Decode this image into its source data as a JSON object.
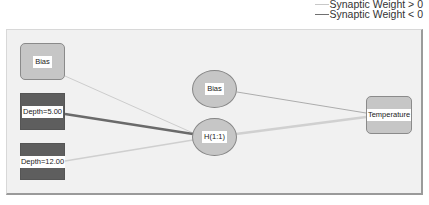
{
  "legend": {
    "positive_label": "Synaptic Weight > 0",
    "negative_label": "Synaptic Weight < 0",
    "positive_color": "#c8c8c8",
    "negative_color": "#707070"
  },
  "layers": {
    "input": [
      {
        "id": "input-bias",
        "label": "Bias",
        "style": "light"
      },
      {
        "id": "input-depth-5",
        "label": "Depth=5.00",
        "style": "dark"
      },
      {
        "id": "input-depth-12",
        "label": "Depth=12.00",
        "style": "dark"
      }
    ],
    "hidden": [
      {
        "id": "hidden-bias",
        "label": "Bias"
      },
      {
        "id": "hidden-h11",
        "label": "H(1:1)"
      }
    ],
    "output": [
      {
        "id": "output-temperature",
        "label": "Temperature"
      }
    ]
  },
  "connections": [
    {
      "from": "input-bias",
      "to": "hidden-h11",
      "sign": "positive",
      "weight": "thin"
    },
    {
      "from": "input-depth-5",
      "to": "hidden-h11",
      "sign": "negative",
      "weight": "thick"
    },
    {
      "from": "input-depth-12",
      "to": "hidden-h11",
      "sign": "positive",
      "weight": "medium"
    },
    {
      "from": "hidden-bias",
      "to": "output-temperature",
      "sign": "negative",
      "weight": "thin"
    },
    {
      "from": "hidden-h11",
      "to": "output-temperature",
      "sign": "positive",
      "weight": "thick"
    }
  ]
}
